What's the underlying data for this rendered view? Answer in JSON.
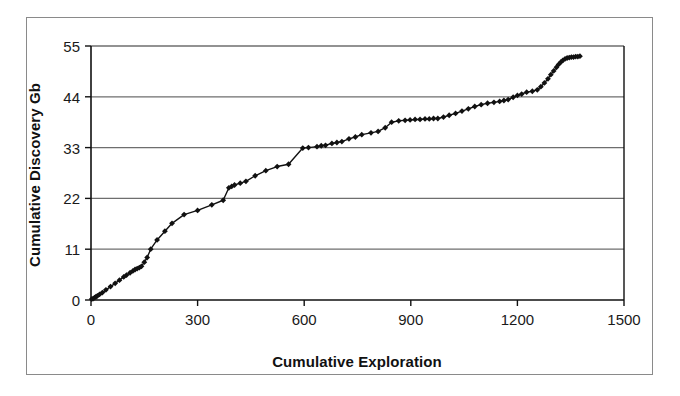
{
  "chart_data": {
    "type": "line",
    "title": "",
    "subtitle": "",
    "xlabel": "Cumulative Exploration",
    "ylabel": "Cumulative Discovery Gb",
    "xlim": [
      0,
      1500
    ],
    "ylim": [
      0,
      55
    ],
    "xticks": [
      0,
      300,
      600,
      900,
      1200,
      1500
    ],
    "yticks": [
      0,
      11,
      22,
      33,
      44,
      55
    ],
    "xtick_labels": [
      "0",
      "300",
      "600",
      "900",
      "1200",
      "1500"
    ],
    "ytick_labels": [
      "0",
      "11",
      "22",
      "33",
      "44",
      "55"
    ],
    "grid": "horizontal",
    "legend": "none",
    "marker": "diamond",
    "line_color": "#111111",
    "marker_color": "#111111",
    "grid_color": "#6e6e6e",
    "axis_color": "#111111",
    "series": [
      {
        "name": "Cumulative Discovery",
        "points": [
          [
            2,
            0.2
          ],
          [
            6,
            0.3
          ],
          [
            10,
            0.5
          ],
          [
            14,
            0.7
          ],
          [
            18,
            0.9
          ],
          [
            24,
            1.2
          ],
          [
            32,
            1.6
          ],
          [
            42,
            2.2
          ],
          [
            55,
            2.9
          ],
          [
            68,
            3.6
          ],
          [
            80,
            4.3
          ],
          [
            92,
            5.0
          ],
          [
            100,
            5.4
          ],
          [
            110,
            5.9
          ],
          [
            118,
            6.3
          ],
          [
            124,
            6.6
          ],
          [
            130,
            6.8
          ],
          [
            136,
            7.0
          ],
          [
            142,
            7.3
          ],
          [
            150,
            8.2
          ],
          [
            158,
            9.2
          ],
          [
            168,
            11.0
          ],
          [
            186,
            13.0
          ],
          [
            208,
            14.9
          ],
          [
            228,
            16.6
          ],
          [
            262,
            18.5
          ],
          [
            300,
            19.4
          ],
          [
            340,
            20.6
          ],
          [
            372,
            21.6
          ],
          [
            388,
            24.3
          ],
          [
            396,
            24.6
          ],
          [
            404,
            24.9
          ],
          [
            420,
            25.3
          ],
          [
            436,
            25.7
          ],
          [
            462,
            26.9
          ],
          [
            492,
            28.0
          ],
          [
            524,
            28.9
          ],
          [
            556,
            29.4
          ],
          [
            596,
            32.9
          ],
          [
            612,
            33.0
          ],
          [
            636,
            33.2
          ],
          [
            648,
            33.4
          ],
          [
            660,
            33.5
          ],
          [
            678,
            33.9
          ],
          [
            692,
            34.1
          ],
          [
            706,
            34.3
          ],
          [
            726,
            34.9
          ],
          [
            744,
            35.3
          ],
          [
            762,
            35.8
          ],
          [
            788,
            36.2
          ],
          [
            808,
            36.5
          ],
          [
            828,
            37.3
          ],
          [
            846,
            38.5
          ],
          [
            866,
            38.8
          ],
          [
            884,
            38.9
          ],
          [
            898,
            39.0
          ],
          [
            912,
            39.1
          ],
          [
            926,
            39.1
          ],
          [
            940,
            39.2
          ],
          [
            952,
            39.2
          ],
          [
            964,
            39.3
          ],
          [
            976,
            39.3
          ],
          [
            992,
            39.6
          ],
          [
            1008,
            40.0
          ],
          [
            1026,
            40.4
          ],
          [
            1044,
            40.9
          ],
          [
            1062,
            41.4
          ],
          [
            1080,
            41.9
          ],
          [
            1098,
            42.3
          ],
          [
            1116,
            42.6
          ],
          [
            1134,
            42.8
          ],
          [
            1150,
            43.0
          ],
          [
            1162,
            43.2
          ],
          [
            1174,
            43.4
          ],
          [
            1188,
            43.9
          ],
          [
            1200,
            44.3
          ],
          [
            1212,
            44.6
          ],
          [
            1226,
            45.0
          ],
          [
            1242,
            45.2
          ],
          [
            1256,
            45.5
          ],
          [
            1266,
            46.2
          ],
          [
            1276,
            47.0
          ],
          [
            1286,
            47.9
          ],
          [
            1294,
            48.8
          ],
          [
            1302,
            49.6
          ],
          [
            1310,
            50.4
          ],
          [
            1316,
            51.0
          ],
          [
            1322,
            51.5
          ],
          [
            1328,
            51.9
          ],
          [
            1334,
            52.2
          ],
          [
            1340,
            52.4
          ],
          [
            1346,
            52.5
          ],
          [
            1352,
            52.6
          ],
          [
            1358,
            52.6
          ],
          [
            1364,
            52.7
          ],
          [
            1370,
            52.7
          ],
          [
            1376,
            52.8
          ]
        ]
      }
    ]
  }
}
